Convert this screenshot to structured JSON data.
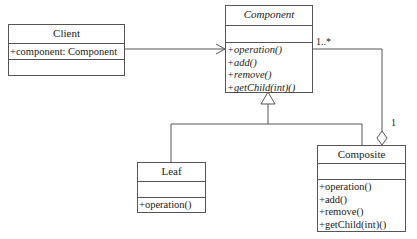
{
  "diagram": {
    "type": "uml-class-diagram",
    "classes": {
      "client": {
        "name": "Client",
        "attributes": [
          "+component: Component"
        ],
        "operations": []
      },
      "component": {
        "name": "Component",
        "abstract": true,
        "attributes": [],
        "operations": [
          "+operation()",
          "+add()",
          "+remove()",
          "+getChild(int)()"
        ]
      },
      "leaf": {
        "name": "Leaf",
        "attributes": [],
        "operations": [
          "+operation()"
        ]
      },
      "composite": {
        "name": "Composite",
        "attributes": [],
        "operations": [
          "+operation()",
          "+add()",
          "+remove()",
          "+getChild(int)()"
        ]
      }
    },
    "relationships": [
      {
        "type": "association",
        "from": "Client",
        "to": "Component"
      },
      {
        "type": "generalization",
        "from": "Leaf",
        "to": "Component"
      },
      {
        "type": "generalization",
        "from": "Composite",
        "to": "Component"
      },
      {
        "type": "aggregation",
        "whole": "Composite",
        "part": "Component",
        "multiplicity_part": "1..*",
        "multiplicity_whole": "1"
      }
    ],
    "labels": {
      "multiplicity_many": "1..*",
      "multiplicity_one": "1"
    },
    "colors": {
      "line": "#555555",
      "background": "#ffffff",
      "text": "#222222"
    }
  }
}
